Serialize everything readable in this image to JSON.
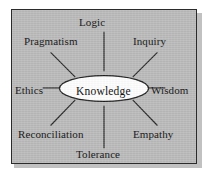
{
  "diagram": {
    "type": "radial-spoke-hub",
    "hub": {
      "label": "Knowledge"
    },
    "nodes": [
      {
        "id": "logic",
        "label": "Logic",
        "position": "top"
      },
      {
        "id": "inquiry",
        "label": "Inquiry",
        "position": "top-right"
      },
      {
        "id": "wisdom",
        "label": "Wisdom",
        "position": "right"
      },
      {
        "id": "empathy",
        "label": "Empathy",
        "position": "bottom-right"
      },
      {
        "id": "tolerance",
        "label": "Tolerance",
        "position": "bottom"
      },
      {
        "id": "reconciliation",
        "label": "Reconciliation",
        "position": "bottom-left"
      },
      {
        "id": "ethics",
        "label": "Ethics",
        "position": "left"
      },
      {
        "id": "pragmatism",
        "label": "Pragmatism",
        "position": "top-left"
      }
    ],
    "colors": {
      "background": "#b9b9b9",
      "border": "#2b2b2b",
      "line": "#232323",
      "hub_fill": "#fdfdfd",
      "text": "#1b1b1b"
    }
  }
}
